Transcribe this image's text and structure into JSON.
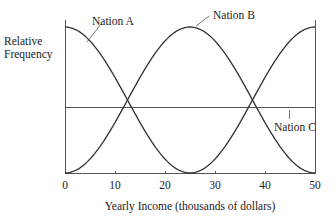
{
  "chart_data": {
    "type": "line",
    "title": "",
    "xlabel": "Yearly Income (thousands of dollars)",
    "ylabel": "Relative Frequency",
    "xlim": [
      0,
      50
    ],
    "ylim": [
      0,
      1
    ],
    "grid": false,
    "legend": "none (curves labeled directly)",
    "x_ticks": [
      0,
      10,
      20,
      30,
      40,
      50
    ],
    "x_tick_labels": [
      "0",
      "10",
      "20",
      "30",
      "40",
      "50"
    ],
    "y_ticks": [],
    "series": [
      {
        "name": "Nation A",
        "shape": "bell curve peaking at x=0, near zero at x=25",
        "x": [
          0,
          5,
          10,
          12.5,
          15,
          20,
          25
        ],
        "y": [
          1.0,
          0.9,
          0.65,
          0.5,
          0.35,
          0.1,
          0.0
        ]
      },
      {
        "name": "Nation B",
        "shape": "bell curve peaking at x=25, near zero at x=0 and x=50",
        "x": [
          0,
          5,
          10,
          12.5,
          15,
          20,
          25,
          30,
          35,
          37.5,
          40,
          45,
          50
        ],
        "y": [
          0.0,
          0.1,
          0.35,
          0.5,
          0.65,
          0.9,
          1.0,
          0.9,
          0.65,
          0.5,
          0.35,
          0.1,
          0.0
        ]
      },
      {
        "name": "Nation A (repeated / right tail)",
        "shape": "rising curve from zero at x=25 to peak at x=50",
        "x": [
          25,
          30,
          35,
          37.5,
          40,
          45,
          50
        ],
        "y": [
          0.0,
          0.1,
          0.35,
          0.5,
          0.65,
          0.9,
          1.0
        ]
      },
      {
        "name": "Nation C",
        "shape": "horizontal line (uniform)",
        "x": [
          0,
          50
        ],
        "y": [
          0.45,
          0.45
        ]
      }
    ],
    "annotations": [
      {
        "text": "Nation A",
        "points_to": "left descending curve near x=5"
      },
      {
        "text": "Nation B",
        "points_to": "peak of middle curve at x=25"
      },
      {
        "text": "Nation C",
        "points_to": "horizontal line near x=45",
        "position": "below line"
      }
    ]
  },
  "labels": {
    "ylabel_line1": "Relative",
    "ylabel_line2": "Frequency",
    "xlabel": "Yearly Income (thousands of dollars)",
    "nation_a": "Nation A",
    "nation_b": "Nation B",
    "nation_c": "Nation C",
    "ticks": [
      "0",
      "10",
      "20",
      "30",
      "40",
      "50"
    ]
  }
}
